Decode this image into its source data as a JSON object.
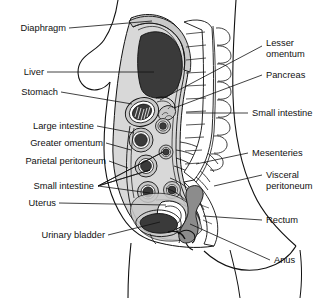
{
  "figure": {
    "type": "anatomical-diagram",
    "background_color": "#ffffff",
    "line_color": "#111111",
    "label_font_size_px": 9.3
  },
  "palette": {
    "organ_dark": "#3a3a3a",
    "organ_mid": "#8c8c8c",
    "organ_light": "#c9c9c9",
    "peritoneum_fill": "#b4b4b4",
    "cavity_fill": "#d8d8d8",
    "white": "#ffffff",
    "outline": "#111111"
  },
  "labels_left": [
    {
      "id": "diaphragm",
      "text": "Diaphragm",
      "x": 66,
      "y": 31,
      "tip_x": 152,
      "tip_y": 21
    },
    {
      "id": "liver",
      "text": "Liver",
      "x": 44,
      "y": 75,
      "tip_x": 134,
      "tip_y": 75
    },
    {
      "id": "stomach",
      "text": "Stomach",
      "x": 58,
      "y": 95,
      "tip_x": 130,
      "tip_y": 98
    },
    {
      "id": "large-intestine",
      "text": "Large intestine",
      "x": 94,
      "y": 129,
      "tip_x": 137,
      "tip_y": 126
    },
    {
      "id": "greater-omentum",
      "text": "Greater omentum",
      "x": 103,
      "y": 146,
      "tip_x": 133,
      "tip_y": 152
    },
    {
      "id": "parietal-peritoneum",
      "text": "Parietal peritoneum",
      "x": 106,
      "y": 164,
      "tip_x": 128,
      "tip_y": 168
    },
    {
      "id": "small-intestine-l",
      "text": "Small intestine",
      "x": 94,
      "y": 189,
      "tip_x": 162,
      "tip_y": 172
    },
    {
      "id": "uterus",
      "text": "Uterus",
      "x": 56,
      "y": 206,
      "tip_x": 165,
      "tip_y": 203
    },
    {
      "id": "urinary-bladder",
      "text": "Urinary bladder",
      "x": 105,
      "y": 238,
      "tip_x": 168,
      "tip_y": 222
    }
  ],
  "labels_right": [
    {
      "id": "lesser-omentum",
      "text": "Lesser omentum",
      "line1": "Lesser",
      "line2": "omentum",
      "x": 266,
      "y": 43,
      "tip_x": 152,
      "tip_y": 93
    },
    {
      "id": "pancreas",
      "text": "Pancreas",
      "line1": "Pancreas",
      "line2": "",
      "x": 266,
      "y": 78,
      "tip_x": 175,
      "tip_y": 104
    },
    {
      "id": "small-intestine-r",
      "text": "Small intestine",
      "line1": "Small intestine",
      "line2": "",
      "x": 252,
      "y": 116,
      "tip_x": 182,
      "tip_y": 116
    },
    {
      "id": "mesenteries",
      "text": "Mesenteries",
      "line1": "Mesenteries",
      "line2": "",
      "x": 252,
      "y": 156,
      "tip_x": 178,
      "tip_y": 164
    },
    {
      "id": "visceral-peritoneum",
      "text": "Visceral peritoneum",
      "line1": "Visceral",
      "line2": "peritoneum",
      "x": 266,
      "y": 178,
      "tip_x": 206,
      "tip_y": 196
    },
    {
      "id": "rectum",
      "text": "Rectum",
      "line1": "Rectum",
      "line2": "",
      "x": 266,
      "y": 223,
      "tip_x": 205,
      "tip_y": 221
    },
    {
      "id": "anus",
      "text": "Anus",
      "line1": "Anus",
      "line2": "",
      "x": 274,
      "y": 263,
      "tip_x": 188,
      "tip_y": 225
    }
  ],
  "structures": [
    {
      "id": "liver",
      "name": "Liver",
      "shade": "organ_dark"
    },
    {
      "id": "stomach",
      "name": "Stomach",
      "shade": "organ_dark"
    },
    {
      "id": "large-intestine",
      "name": "Large intestine",
      "shade": "organ_dark"
    },
    {
      "id": "small-intestine",
      "name": "Small intestine",
      "shade": "organ_dark"
    },
    {
      "id": "pancreas",
      "name": "Pancreas",
      "shade": "organ_light"
    },
    {
      "id": "uterus",
      "name": "Uterus",
      "shade": "organ_mid"
    },
    {
      "id": "urinary-bladder",
      "name": "Urinary bladder",
      "shade": "organ_dark"
    },
    {
      "id": "rectum",
      "name": "Rectum",
      "shade": "organ_mid"
    },
    {
      "id": "vertebral-column",
      "name": "Vertebral column",
      "shade": "white"
    },
    {
      "id": "greater-omentum",
      "name": "Greater omentum",
      "shade": "peritoneum_fill"
    },
    {
      "id": "lesser-omentum",
      "name": "Lesser omentum",
      "shade": "peritoneum_fill"
    },
    {
      "id": "mesenteries",
      "name": "Mesenteries",
      "shade": "white"
    },
    {
      "id": "parietal-peritoneum",
      "name": "Parietal peritoneum",
      "shade": "cavity_fill"
    },
    {
      "id": "visceral-peritoneum",
      "name": "Visceral peritoneum",
      "shade": "cavity_fill"
    },
    {
      "id": "diaphragm",
      "name": "Diaphragm",
      "shade": "cavity_fill"
    }
  ]
}
